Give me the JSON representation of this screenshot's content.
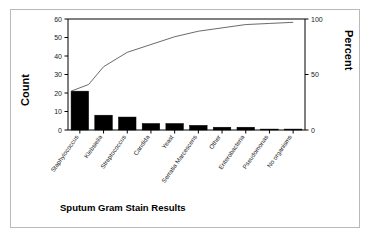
{
  "figure": {
    "x_axis_title": "Sputum Gram Stain Results",
    "left_axis_title": "Count",
    "right_axis_title": "Percent"
  },
  "chart_data": {
    "type": "bar",
    "chart_kind": "pareto",
    "title": "",
    "xlabel": "Sputum Gram Stain Results",
    "ylabel": "Count",
    "y2label": "Percent",
    "ylim": [
      0,
      60
    ],
    "y2lim": [
      0,
      100
    ],
    "grid": false,
    "legend": "none",
    "categories": [
      "Staphylococcus",
      "Klebsiella",
      "Streptococcus",
      "Candida",
      "Yeast",
      "Serratia Marcescens",
      "Other",
      "Enterobacteria",
      "Pseudomonas",
      "No organisms"
    ],
    "values": [
      21,
      8,
      7,
      3.5,
      3.5,
      2.5,
      1.5,
      1.5,
      0.5,
      0.5
    ],
    "cumulative_percent": [
      41,
      57,
      70,
      77,
      84,
      89,
      92,
      95,
      96,
      97
    ],
    "left_ticks": [
      0,
      10,
      20,
      30,
      40,
      50,
      60
    ],
    "right_ticks": [
      0,
      50,
      100
    ],
    "series": [
      {
        "name": "Count",
        "type": "bar",
        "values": [
          21,
          8,
          7,
          3.5,
          3.5,
          2.5,
          1.5,
          1.5,
          0.5,
          0.5
        ]
      },
      {
        "name": "Percent",
        "type": "line",
        "values": [
          41,
          57,
          70,
          77,
          84,
          89,
          92,
          95,
          96,
          97
        ]
      }
    ]
  }
}
